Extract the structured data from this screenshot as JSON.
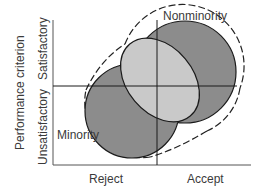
{
  "diagram": {
    "y_axis_title": "Performance criterion",
    "y_levels": {
      "top": "Satisfactory",
      "bottom": "Unsatisfactory"
    },
    "x_levels": {
      "left": "Reject",
      "right": "Accept"
    },
    "groups": [
      {
        "name": "Nonminority",
        "shade": "#8c8c8c"
      },
      {
        "name": "Minority",
        "shade": "#8c8c8c"
      }
    ],
    "overlap_shade": "#c9c9c9",
    "combined_outline": "dashed"
  }
}
